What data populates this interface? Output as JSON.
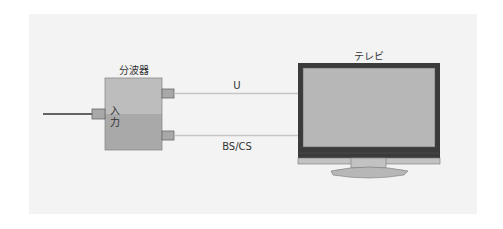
{
  "diagram": {
    "splitter": {
      "label": "分波器",
      "input_label_line1": "入",
      "input_label_line2": "力"
    },
    "cables": [
      {
        "name": "U",
        "label": "U"
      },
      {
        "name": "BS/CS",
        "label": "BS/CS"
      }
    ],
    "tv": {
      "label": "テレビ"
    },
    "colors": {
      "background_panel": "#f3f3f3",
      "splitter_top": "#bdbdbd",
      "splitter_bottom": "#a9a9a9",
      "connector": "#a8a8a8",
      "cable": "#c6c6c6",
      "antenna_cable": "#333333",
      "tv_frame": "#3b3b3b",
      "tv_screen": "#b7b7b7",
      "tv_stand": "#bdbdbd"
    }
  }
}
